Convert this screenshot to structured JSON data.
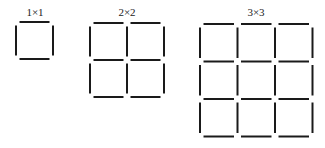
{
  "diagram": {
    "stroke_color": "#1a1a1a",
    "background": "#ffffff",
    "grids": [
      {
        "label": "1×1",
        "n": 1,
        "origin": [
          16,
          22
        ],
        "cell": 37,
        "label_pos": [
          35,
          16
        ]
      },
      {
        "label": "2×2",
        "n": 2,
        "origin": [
          90,
          23
        ],
        "cell": 37,
        "label_pos": [
          127,
          16
        ]
      },
      {
        "label": "3×3",
        "n": 3,
        "origin": [
          200,
          24
        ],
        "cell": 37.5,
        "label_pos": [
          256,
          16
        ]
      }
    ]
  }
}
